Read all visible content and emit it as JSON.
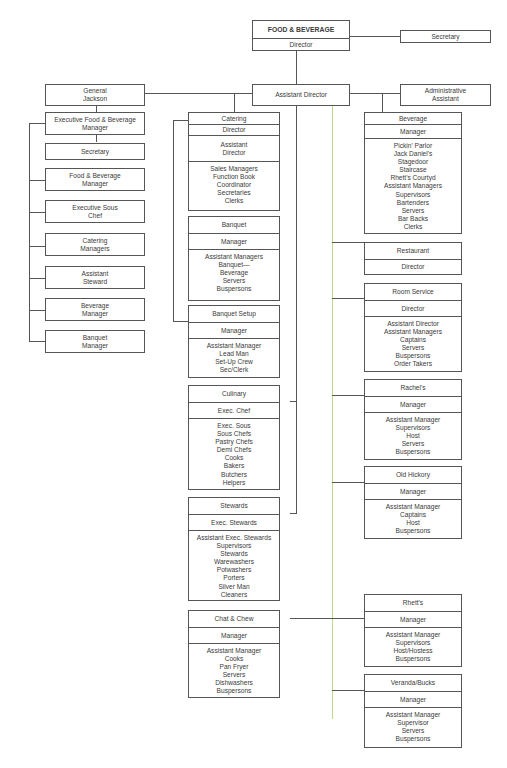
{
  "top": {
    "title": "FOOD & BEVERAGE",
    "director": "Director",
    "secretary": "Secretary",
    "assistant_director": "Assistant Director",
    "administrative_assistant": "Administrative Assistant"
  },
  "general_jackson": {
    "title": "General Jackson",
    "items": [
      "Executive Food & Beverage Manager",
      "Secretary",
      "Food & Beverage Manager",
      "Executive Sous Chef",
      "Catering Managers",
      "Assistant Steward",
      "Beverage Manager",
      "Banquet Manager"
    ]
  },
  "middle": [
    {
      "name": "Catering",
      "head": "Director",
      "sub": "Assistant Director",
      "staff": [
        "Sales Managers",
        "Function Book",
        "Coordinator",
        "Secretaries",
        "Clerks"
      ]
    },
    {
      "name": "Banquet",
      "head": "Manager",
      "staff": [
        "Assistant Managers",
        "Banquet—",
        "Beverage",
        "Servers",
        "Buspersons"
      ]
    },
    {
      "name": "Banquet Setup",
      "head": "Manager",
      "staff": [
        "Assistant Manager",
        "Lead Man",
        "Set-Up Crew",
        "Sec/Clerk"
      ]
    },
    {
      "name": "Culinary",
      "head": "Exec. Chef",
      "staff": [
        "Exec. Sous",
        "Sous Chefs",
        "Pastry Chefs",
        "Demi Chefs",
        "Cooks",
        "Bakers",
        "Butchers",
        "Helpers"
      ]
    },
    {
      "name": "Stewards",
      "head": "Exec. Stewards",
      "staff": [
        "Assistant Exec. Stewards",
        "Supervisors",
        "Stewards",
        "Warewashers",
        "Potwashers",
        "Porters",
        "Silver Man",
        "Cleaners"
      ]
    },
    {
      "name": "Chat & Chew",
      "head": "Manager",
      "staff": [
        "Assistant Manager",
        "Cooks",
        "Pan Fryer",
        "Servers",
        "Dishwashers",
        "Buspersons"
      ]
    }
  ],
  "right": [
    {
      "name": "Beverage",
      "head": "Manager",
      "staff": [
        "Pickin' Parlor",
        "Jack Daniel's",
        "Stagedoor",
        "Staircase",
        "Rhett's Courtyd",
        "Assistant Managers",
        "Supervisors",
        "Bartenders",
        "Servers",
        "Bar Backs",
        "Clerks"
      ]
    },
    {
      "name": "Restaurant",
      "head": "Director",
      "staff": []
    },
    {
      "name": "Room Service",
      "head": "Director",
      "staff": [
        "Assistant Director",
        "Assistant Managers",
        "Captains",
        "Servers",
        "Buspersons",
        "Order Takers"
      ]
    },
    {
      "name": "Rachel's",
      "head": "Manager",
      "staff": [
        "Assistant Manager",
        "Supervisors",
        "Host",
        "Servers",
        "Buspersons"
      ]
    },
    {
      "name": "Old Hickory",
      "head": "Manager",
      "staff": [
        "Assistant Manager",
        "Captains",
        "Host",
        "Buspersons"
      ]
    },
    {
      "name": "Rhett's",
      "head": "Manager",
      "staff": [
        "Assistant Manager",
        "Supervisors",
        "Host/Hostess",
        "Buspersons"
      ]
    },
    {
      "name": "Veranda/Bucks",
      "head": "Manager",
      "staff": [
        "Assistant Manager",
        "Supervisor",
        "Servers",
        "Buspersons"
      ]
    }
  ]
}
